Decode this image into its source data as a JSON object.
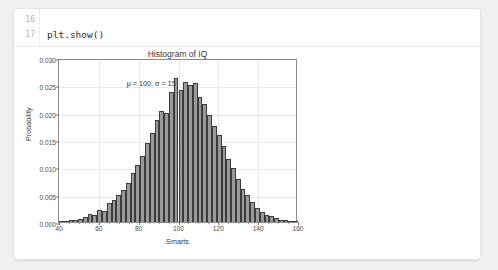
{
  "editor": {
    "lines": [
      {
        "number": "16",
        "text": ""
      },
      {
        "number": "17",
        "text": "plt.show()"
      }
    ]
  },
  "chart_data": {
    "type": "bar",
    "title": "Histogram of IQ",
    "xlabel": "Smarts",
    "ylabel": "Probability",
    "xlim": [
      40,
      160
    ],
    "ylim": [
      0.0,
      0.03
    ],
    "grid": true,
    "legend": null,
    "annotation": "μ = 100, σ = 15",
    "annotation_x": 74,
    "annotation_y": 0.0265,
    "xticks": [
      "40",
      "60",
      "80",
      "100",
      "120",
      "140",
      "160"
    ],
    "xtick_values": [
      40,
      60,
      80,
      100,
      120,
      140,
      160
    ],
    "yticks": [
      "0.000",
      "0.005",
      "0.010",
      "0.015",
      "0.020",
      "0.025",
      "0.030"
    ],
    "ytick_values": [
      0.0,
      0.005,
      0.01,
      0.015,
      0.02,
      0.025,
      0.03
    ],
    "bar_color": "#9a9a9a",
    "bar_edge_color": "#3c3c3c",
    "bin_width": 2.4,
    "x": [
      41.2,
      43.6,
      46.0,
      48.4,
      50.8,
      53.2,
      55.6,
      58.0,
      60.4,
      62.8,
      65.2,
      67.6,
      70.0,
      72.4,
      74.8,
      77.2,
      79.6,
      82.0,
      84.4,
      86.8,
      89.2,
      91.6,
      94.0,
      96.4,
      98.8,
      101.2,
      103.6,
      106.0,
      108.4,
      110.8,
      113.2,
      115.6,
      118.0,
      120.4,
      122.8,
      125.2,
      127.6,
      130.0,
      132.4,
      134.8,
      137.2,
      139.6,
      142.0,
      144.4,
      146.8,
      149.2,
      151.6,
      154.0,
      156.4,
      158.8
    ],
    "values": [
      0.0002,
      0.0,
      0.0003,
      0.0004,
      0.0006,
      0.0009,
      0.0014,
      0.0013,
      0.0022,
      0.002,
      0.0035,
      0.0041,
      0.005,
      0.0059,
      0.0072,
      0.0089,
      0.0105,
      0.012,
      0.0144,
      0.0163,
      0.0186,
      0.0203,
      0.0199,
      0.0237,
      0.0263,
      0.0241,
      0.0257,
      0.0251,
      0.0255,
      0.0229,
      0.0215,
      0.0196,
      0.0175,
      0.0159,
      0.0139,
      0.0116,
      0.0098,
      0.0078,
      0.0061,
      0.0049,
      0.0036,
      0.0026,
      0.0018,
      0.0013,
      0.0011,
      0.0008,
      0.0004,
      0.0003,
      0.0002,
      0.0001
    ]
  }
}
